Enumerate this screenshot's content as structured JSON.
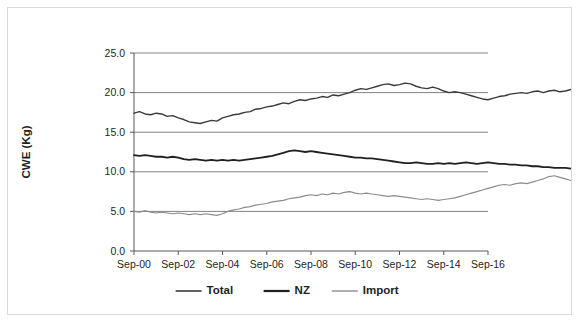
{
  "chart_data": {
    "type": "line",
    "title": "",
    "xlabel": "",
    "ylabel": "CWE (Kg)",
    "ylim": [
      0.0,
      25.0
    ],
    "yticks": [
      "0.0",
      "5.0",
      "10.0",
      "15.0",
      "20.0",
      "25.0"
    ],
    "ytick_values": [
      0.0,
      5.0,
      10.0,
      15.0,
      20.0,
      25.0
    ],
    "xticks": [
      "Sep-00",
      "Sep-02",
      "Sep-04",
      "Sep-06",
      "Sep-08",
      "Sep-10",
      "Sep-12",
      "Sep-14",
      "Sep-16"
    ],
    "xtick_values": [
      2000.67,
      2002.67,
      2004.67,
      2006.67,
      2008.67,
      2010.67,
      2012.67,
      2014.67,
      2016.67
    ],
    "xlim": [
      2000.67,
      2016.67
    ],
    "grid": "horizontal",
    "legend_position": "bottom",
    "x_start": 2000.67,
    "x_step": 0.25,
    "series": [
      {
        "name": "Total",
        "color": "#3a3a3c",
        "width": 1.4,
        "values": [
          17.4,
          17.6,
          17.3,
          17.2,
          17.4,
          17.3,
          17.0,
          17.1,
          16.8,
          16.6,
          16.3,
          16.2,
          16.1,
          16.3,
          16.5,
          16.4,
          16.8,
          17.0,
          17.2,
          17.3,
          17.5,
          17.6,
          17.9,
          18.0,
          18.2,
          18.3,
          18.5,
          18.7,
          18.6,
          18.9,
          19.1,
          19.0,
          19.2,
          19.3,
          19.5,
          19.4,
          19.7,
          19.6,
          19.8,
          20.0,
          20.3,
          20.5,
          20.4,
          20.6,
          20.8,
          21.0,
          21.1,
          20.9,
          21.0,
          21.2,
          21.1,
          20.8,
          20.6,
          20.5,
          20.7,
          20.5,
          20.2,
          20.0,
          20.1,
          20.0,
          19.8,
          19.6,
          19.4,
          19.2,
          19.1,
          19.3,
          19.5,
          19.6,
          19.8,
          19.9,
          20.0,
          19.9,
          20.1,
          20.2,
          20.0,
          20.2,
          20.3,
          20.1,
          20.2,
          20.4,
          20.3,
          20.5,
          20.7,
          20.6,
          20.8,
          21.0,
          21.3,
          21.7,
          22.2,
          22.7,
          22.6,
          22.8,
          23.0,
          22.6,
          22.4,
          22.6,
          22.3,
          22.0,
          21.8
        ]
      },
      {
        "name": "NZ",
        "color": "#231f20",
        "width": 1.8,
        "values": [
          12.1,
          12.0,
          12.1,
          12.0,
          11.9,
          11.9,
          11.8,
          11.9,
          11.8,
          11.6,
          11.5,
          11.6,
          11.5,
          11.4,
          11.5,
          11.4,
          11.5,
          11.4,
          11.5,
          11.4,
          11.5,
          11.6,
          11.7,
          11.8,
          11.9,
          12.0,
          12.2,
          12.4,
          12.6,
          12.7,
          12.6,
          12.5,
          12.6,
          12.5,
          12.4,
          12.3,
          12.2,
          12.1,
          12.0,
          11.9,
          11.8,
          11.8,
          11.7,
          11.7,
          11.6,
          11.5,
          11.4,
          11.3,
          11.2,
          11.1,
          11.1,
          11.2,
          11.1,
          11.0,
          11.0,
          11.1,
          11.0,
          11.1,
          11.0,
          11.1,
          11.2,
          11.1,
          11.0,
          11.1,
          11.2,
          11.1,
          11.0,
          11.0,
          10.9,
          10.9,
          10.8,
          10.8,
          10.7,
          10.7,
          10.6,
          10.6,
          10.5,
          10.5,
          10.5,
          10.4,
          10.4,
          10.4,
          10.3,
          10.3,
          10.3,
          10.2,
          10.1,
          10.0,
          9.9,
          9.9,
          9.8,
          9.7,
          9.6,
          9.5,
          9.4,
          9.4,
          9.3,
          9.3,
          9.3
        ]
      },
      {
        "name": "Import",
        "color": "#8c8c8e",
        "width": 1.2,
        "values": [
          5.0,
          4.9,
          5.1,
          4.9,
          4.8,
          4.9,
          4.8,
          4.7,
          4.8,
          4.7,
          4.6,
          4.7,
          4.6,
          4.7,
          4.6,
          4.5,
          4.7,
          5.0,
          5.2,
          5.3,
          5.5,
          5.6,
          5.8,
          5.9,
          6.0,
          6.2,
          6.3,
          6.4,
          6.6,
          6.7,
          6.8,
          7.0,
          7.1,
          7.0,
          7.2,
          7.1,
          7.3,
          7.2,
          7.4,
          7.5,
          7.3,
          7.2,
          7.3,
          7.2,
          7.1,
          7.0,
          6.9,
          7.0,
          6.9,
          6.8,
          6.7,
          6.6,
          6.5,
          6.6,
          6.5,
          6.4,
          6.5,
          6.6,
          6.7,
          6.9,
          7.1,
          7.3,
          7.5,
          7.7,
          7.9,
          8.1,
          8.3,
          8.4,
          8.3,
          8.5,
          8.6,
          8.5,
          8.7,
          8.9,
          9.1,
          9.4,
          9.5,
          9.3,
          9.1,
          8.9,
          8.8,
          8.7,
          8.9,
          9.1,
          9.3,
          9.5,
          9.8,
          10.3,
          11.0,
          11.8,
          12.4,
          12.7,
          12.8,
          12.6,
          12.9,
          13.1,
          12.9,
          12.6,
          12.7
        ]
      }
    ],
    "legend": [
      {
        "label": "Total",
        "color": "#3a3a3c",
        "width": 1.6
      },
      {
        "label": "NZ",
        "color": "#231f20",
        "width": 2.2
      },
      {
        "label": "Import",
        "color": "#8c8c8e",
        "width": 1.4
      }
    ]
  },
  "figure": {
    "border_color": "#d9d9d9",
    "gridline_color": "#808285",
    "axis_color": "#58595b",
    "text_color": "#231f20"
  }
}
